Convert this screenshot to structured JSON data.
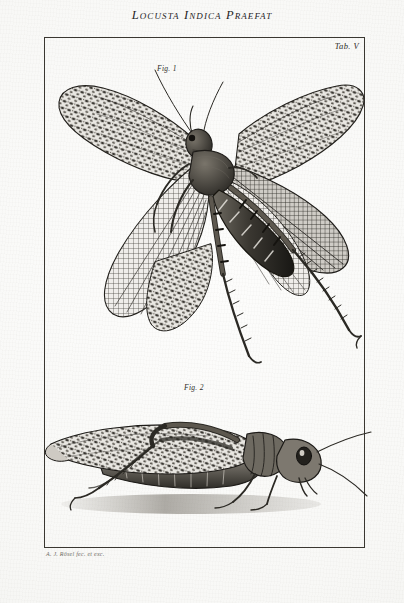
{
  "page": {
    "width": 404,
    "height": 603,
    "paper_color": "#fbfbfa",
    "ink_color": "#2b2924"
  },
  "plate": {
    "title": "Locusta Indica Praefat",
    "table_label": "Tab. V",
    "signature": "A. J. Rösel fec. et exc.",
    "border_color": "#3a3731"
  },
  "figures": [
    {
      "label": "Fig. 1",
      "subject": "locust-dorsal-spread-wings",
      "description": "Indian locust shown from above with both pairs of wings fully spread, mottled forewings and finely reticulated hindwings, banded abdomen and long spined hind legs"
    },
    {
      "label": "Fig. 2",
      "subject": "locust-lateral-at-rest",
      "description": "Indian locust in left lateral view at rest, wings folded over the segmented abdomen, long filiform antennae extending to the right"
    }
  ]
}
